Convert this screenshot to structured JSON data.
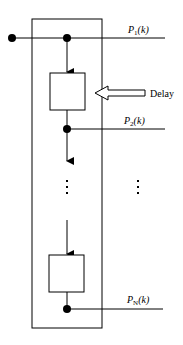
{
  "diagram": {
    "outputs": [
      {
        "label": "P",
        "sub": "1",
        "arg": "(k)"
      },
      {
        "label": "P",
        "sub": "2",
        "arg": "(k)"
      },
      {
        "label": "P",
        "sub": "N",
        "arg": "(k)"
      }
    ],
    "delay_label": "Delay",
    "ellipsis": "⋮",
    "colors": {
      "stroke": "#000000",
      "background": "#ffffff"
    }
  }
}
